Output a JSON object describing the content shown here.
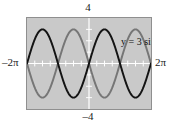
{
  "figure": {
    "name": "graph-of-3-sin-x-and-negative-3-sin-x",
    "background_color": "#ffffff",
    "plot_background_color": "#c9c9c9",
    "plot_border_color": "#8f8f8f",
    "axis_color": "#ffffff"
  },
  "labels": {
    "top": "4",
    "bottom": "–4",
    "left": "–2π",
    "right": "2π",
    "curve1": "y = 3 sin x",
    "curve2": "y = –3 sin x"
  },
  "colors": {
    "curve1": "#141414",
    "curve2": "#767676",
    "axis": "#ffffff",
    "plot_bg": "#c9c9c9",
    "border": "#8f8f8f",
    "text": "#1a1a1a"
  },
  "chart_data": {
    "type": "line",
    "title": "",
    "xlabel": "",
    "ylabel": "",
    "xlim": [
      -6.283185307179586,
      6.283185307179586
    ],
    "ylim": [
      -4,
      4
    ],
    "xtick_labels": [
      "–2π",
      "2π"
    ],
    "ytick_labels": [
      "–4",
      "4"
    ],
    "xticks": [
      -5.497787143782138,
      -4.71238898038469,
      -3.9269908169872414,
      -3.141592653589793,
      -2.356194490192345,
      -1.5707963267948966,
      -0.7853981633974483,
      0.7853981633974483,
      1.5707963267948966,
      2.356194490192345,
      3.141592653589793,
      3.9269908169872414,
      4.71238898038469,
      5.497787143782138
    ],
    "yticks": [
      -3,
      -2,
      -1,
      1,
      2,
      3
    ],
    "grid": false,
    "legend_position": "inside-plot",
    "axes_style": "graphing-calculator-window",
    "series": [
      {
        "name": "y = 3 sin x",
        "color": "#141414",
        "amplitude": 3,
        "period": 6.283185307179586,
        "phase": 0,
        "expression": "3*sin(x)",
        "x": [
          -6.283185307179586,
          -5.890486225480862,
          -5.497787143782138,
          -5.105088062083414,
          -4.71238898038469,
          -4.319689899085965,
          -3.9269908169872414,
          -3.5342917352885173,
          -3.141592653589793,
          -2.748893571891069,
          -2.356194490192345,
          -1.9634954084936207,
          -1.5707963267948966,
          -1.1780972450961724,
          -0.7853981633974483,
          -0.39269908169872414,
          0,
          0.39269908169872414,
          0.7853981633974483,
          1.1780972450961724,
          1.5707963267948966,
          1.9634954084936207,
          2.356194490192345,
          2.748893571891069,
          3.141592653589793,
          3.5342917352885173,
          3.9269908169872414,
          4.319689899085965,
          4.71238898038469,
          5.105088062083414,
          5.497787143782138,
          5.890486225480862,
          6.283185307179586
        ],
        "y": [
          0,
          1.148,
          2.121,
          2.772,
          3,
          2.772,
          2.121,
          1.148,
          0,
          -1.148,
          -2.121,
          -2.772,
          -3,
          -2.772,
          -2.121,
          -1.148,
          0,
          1.148,
          2.121,
          2.772,
          3,
          2.772,
          2.121,
          1.148,
          0,
          -1.148,
          -2.121,
          -2.772,
          -3,
          -2.772,
          -2.121,
          -1.148,
          0
        ]
      },
      {
        "name": "y = –3 sin x",
        "color": "#767676",
        "amplitude": 3,
        "period": 6.283185307179586,
        "phase": 3.141592653589793,
        "expression": "-3*sin(x)",
        "x": [
          -6.283185307179586,
          -5.890486225480862,
          -5.497787143782138,
          -5.105088062083414,
          -4.71238898038469,
          -4.319689899085965,
          -3.9269908169872414,
          -3.5342917352885173,
          -3.141592653589793,
          -2.748893571891069,
          -2.356194490192345,
          -1.9634954084936207,
          -1.5707963267948966,
          -1.1780972450961724,
          -0.7853981633974483,
          -0.39269908169872414,
          0,
          0.39269908169872414,
          0.7853981633974483,
          1.1780972450961724,
          1.5707963267948966,
          1.9634954084936207,
          2.356194490192345,
          2.748893571891069,
          3.141592653589793,
          3.5342917352885173,
          3.9269908169872414,
          4.319689899085965,
          4.71238898038469,
          5.105088062083414,
          5.497787143782138,
          5.890486225480862,
          6.283185307179586
        ],
        "y": [
          0,
          -1.148,
          -2.121,
          -2.772,
          -3,
          -2.772,
          -2.121,
          -1.148,
          0,
          1.148,
          2.121,
          2.772,
          3,
          2.772,
          2.121,
          1.148,
          0,
          -1.148,
          -2.121,
          -2.772,
          -3,
          -2.772,
          -2.121,
          -1.148,
          0,
          1.148,
          2.121,
          2.772,
          3,
          2.772,
          2.121,
          1.148,
          0
        ]
      }
    ],
    "annotations": [
      {
        "text": "y = 3 sin x",
        "x": 0.55,
        "y": 3.55
      },
      {
        "text": "y = –3 sin x",
        "x": 0.55,
        "y": -3.0
      }
    ]
  }
}
